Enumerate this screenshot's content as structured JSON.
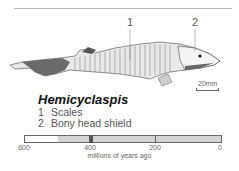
{
  "figure": {
    "title": "Hemicyclaspis",
    "callouts": [
      {
        "number": "1",
        "label": "Scales"
      },
      {
        "number": "2",
        "label": "Bony head shield"
      }
    ],
    "scale_bar_label": "20mm"
  },
  "timeline": {
    "ticks": [
      "600",
      "400",
      "200",
      "0"
    ],
    "caption": "millions of years ago",
    "marker_value": 400,
    "range_start": 500,
    "range_end": 0
  }
}
